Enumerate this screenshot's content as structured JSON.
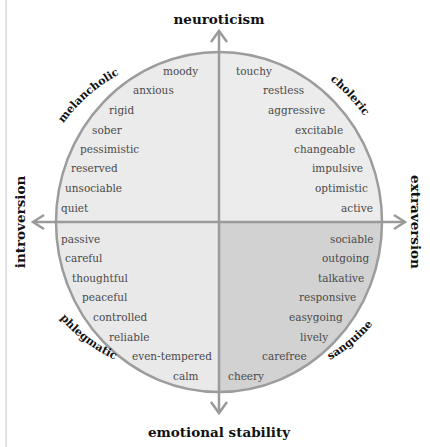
{
  "axes": {
    "top": "neuroticism",
    "bottom": "emotional stability",
    "left": "introversion",
    "right": "extraversion"
  },
  "temperaments": {
    "top_left": "melancholic",
    "top_right": "choleric",
    "bottom_left": "phlegmatic",
    "bottom_right": "sanguine"
  },
  "colors": {
    "light_fill": "#ebebeb",
    "dark_fill": "#d2d2d2",
    "outline": "#9c9c9c",
    "axis": "#9a9a9a"
  },
  "quadrants": {
    "melancholic": [
      "moody",
      "anxious",
      "rigid",
      "sober",
      "pessimistic",
      "reserved",
      "unsociable",
      "quiet"
    ],
    "choleric": [
      "touchy",
      "restless",
      "aggressive",
      "excitable",
      "changeable",
      "impulsive",
      "optimistic",
      "active"
    ],
    "phlegmatic": [
      "passive",
      "careful",
      "thoughtful",
      "peaceful",
      "controlled",
      "reliable",
      "even-tempered",
      "calm"
    ],
    "sanguine": [
      "sociable",
      "outgoing",
      "talkative",
      "responsive",
      "easygoing",
      "lively",
      "carefree",
      "cheery"
    ]
  }
}
